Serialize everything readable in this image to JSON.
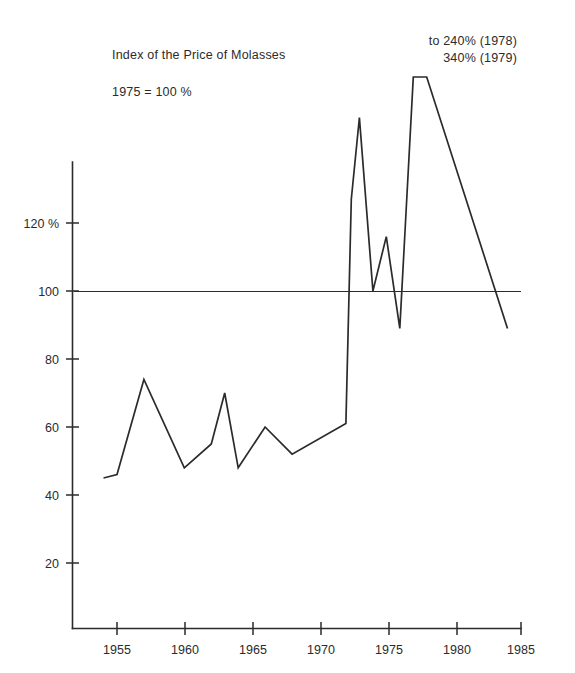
{
  "chart_data": {
    "type": "line",
    "title": "Index of the Price of Molasses",
    "subtitle": "1975 = 100 %",
    "xlabel": "",
    "ylabel": "",
    "xlim": [
      1953,
      1985
    ],
    "ylim": [
      0,
      150
    ],
    "grid": false,
    "legend": "none",
    "y_ticks": [
      20,
      40,
      60,
      80,
      100,
      120
    ],
    "y_tick_labels": [
      "20",
      "40",
      "60",
      "80",
      "100",
      "120 %"
    ],
    "x_ticks": [
      1955,
      1960,
      1965,
      1970,
      1975,
      1980,
      1985
    ],
    "x_tick_labels": [
      "1955",
      "1960",
      "1965",
      "1970",
      "1975",
      "1980",
      "1985"
    ],
    "reference_line": {
      "value": 100,
      "label": "1975 = 100 %",
      "x_from": 1954,
      "x_to": 1985
    },
    "annotations": [
      {
        "text": "to 240% (1978)",
        "points_to": 1978,
        "value": 240
      },
      {
        "text": "340% (1979)",
        "points_to": 1979,
        "value": 340
      }
    ],
    "annotation_lines": [
      "to 240% (1978)",
      "340% (1979)"
    ],
    "series": [
      {
        "name": "Index of the Price of Molasses",
        "x": [
          1954,
          1955,
          1957,
          1960,
          1962,
          1963,
          1964,
          1966,
          1968,
          1972,
          1972.4,
          1973,
          1974,
          1975,
          1976,
          1977,
          1978,
          1984
        ],
        "values": [
          45,
          46,
          74,
          48,
          55,
          70,
          48,
          60,
          52,
          61,
          127,
          151,
          100,
          116,
          89,
          240,
          340,
          89
        ]
      }
    ]
  },
  "figure": {
    "title": "Index of the Price of Molasses",
    "subtitle": "1975 = 100 %",
    "annotation_line_1": "to 240% (1978)",
    "annotation_line_2": "340% (1979)",
    "colors": {
      "ink": "#2b2b2b",
      "background": "#ffffff"
    }
  }
}
